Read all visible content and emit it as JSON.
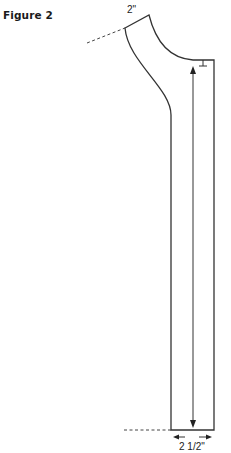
{
  "figure": {
    "title": "Figure 2"
  },
  "labels": {
    "top_width": "2\"",
    "bottom_width": "2 1/2\""
  },
  "colors": {
    "line": "#333333",
    "text": "#1a1a1a"
  }
}
